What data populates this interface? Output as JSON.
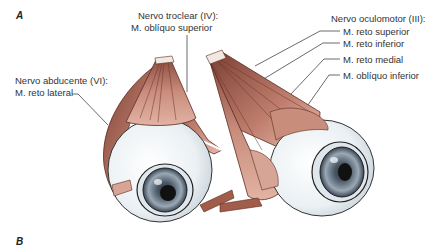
{
  "panels": [
    {
      "id": "A",
      "label": "A"
    },
    {
      "id": "B",
      "label": "B"
    }
  ],
  "labels": {
    "trochlear": {
      "nerve": "Nervo troclear (IV):",
      "muscles": [
        "M. oblíquo superior"
      ]
    },
    "abducens": {
      "nerve": "Nervo abducente (VI):",
      "muscles": [
        "M. reto lateral"
      ]
    },
    "oculomotor": {
      "nerve": "Nervo oculomotor (III):",
      "muscles": [
        "M. reto superior",
        "M. reto inferior",
        "M. reto medial",
        "M. oblíquo inferior"
      ]
    }
  },
  "colors": {
    "muscle": "#c98d7c",
    "muscle_dark": "#7a3f33",
    "sclera": "#eef2f4",
    "iris": "#7d8c9c",
    "pupil": "#111111",
    "leader_line": "#444444"
  },
  "figure": {
    "left_eye_view": "lateral view (right eye)",
    "right_eye_view": "medial view"
  }
}
